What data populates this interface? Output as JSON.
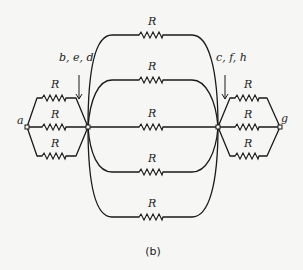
{
  "diagram": {
    "type": "circuit",
    "caption": "(b)",
    "resistor_label": "R",
    "nodes": {
      "a": "a",
      "g": "g",
      "left_junction": "b, e, d",
      "right_junction": "c, f, h"
    },
    "resistors": [
      {
        "id": "left-top",
        "label": "R"
      },
      {
        "id": "left-middle",
        "label": "R"
      },
      {
        "id": "left-bottom",
        "label": "R"
      },
      {
        "id": "center-arc-1",
        "label": "R"
      },
      {
        "id": "center-arc-2",
        "label": "R"
      },
      {
        "id": "center-straight",
        "label": "R"
      },
      {
        "id": "center-arc-4",
        "label": "R"
      },
      {
        "id": "center-arc-5",
        "label": "R"
      },
      {
        "id": "right-top",
        "label": "R"
      },
      {
        "id": "right-middle",
        "label": "R"
      },
      {
        "id": "right-bottom",
        "label": "R"
      }
    ],
    "colors": {
      "background": "#f6f6f4",
      "ink": "#1a1a1a"
    }
  }
}
